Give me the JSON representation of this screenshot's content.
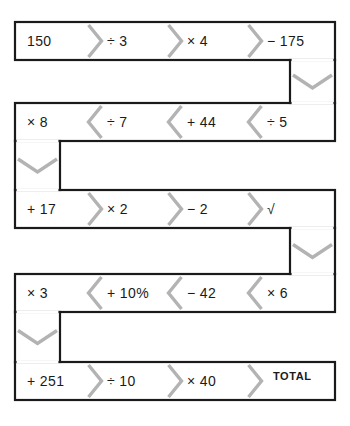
{
  "worksheet": {
    "title": "Number chain function machine",
    "style": {
      "band_stroke": "#1a1a1a",
      "chevron_color": "#b3b3b3",
      "background": "#ffffff",
      "text_color": "#1a1a1a"
    },
    "start_value": "150",
    "end_label": "TOTAL",
    "rows": [
      {
        "index": 1,
        "direction": "right",
        "cells": [
          {
            "label": "150",
            "kind": "start"
          },
          {
            "label": "÷ 3",
            "kind": "operation"
          },
          {
            "label": "× 4",
            "kind": "operation"
          },
          {
            "label": "− 175",
            "kind": "operation"
          }
        ]
      },
      {
        "index": 2,
        "direction": "left",
        "cells": [
          {
            "label": "× 8",
            "kind": "operation"
          },
          {
            "label": "÷ 7",
            "kind": "operation"
          },
          {
            "label": "+ 44",
            "kind": "operation"
          },
          {
            "label": "÷ 5",
            "kind": "operation"
          }
        ]
      },
      {
        "index": 3,
        "direction": "right",
        "cells": [
          {
            "label": "+ 17",
            "kind": "operation"
          },
          {
            "label": "× 2",
            "kind": "operation"
          },
          {
            "label": "− 2",
            "kind": "operation"
          },
          {
            "label": "√",
            "kind": "operation"
          }
        ]
      },
      {
        "index": 4,
        "direction": "left",
        "cells": [
          {
            "label": "× 3",
            "kind": "operation"
          },
          {
            "label": "+ 10%",
            "kind": "operation"
          },
          {
            "label": "− 42",
            "kind": "operation"
          },
          {
            "label": "× 6",
            "kind": "operation"
          }
        ]
      },
      {
        "index": 5,
        "direction": "right",
        "cells": [
          {
            "label": "+ 251",
            "kind": "operation"
          },
          {
            "label": "÷ 10",
            "kind": "operation"
          },
          {
            "label": "× 40",
            "kind": "operation"
          },
          {
            "label": "TOTAL",
            "kind": "total"
          }
        ]
      }
    ]
  }
}
